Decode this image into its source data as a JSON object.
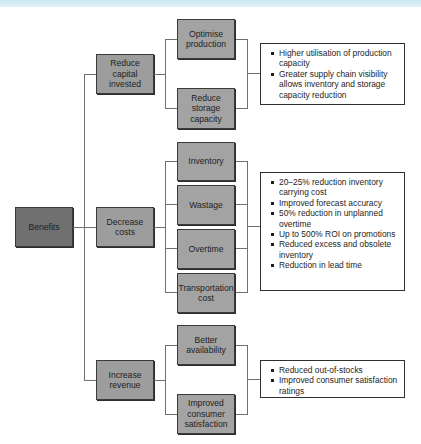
{
  "diagram": {
    "root": {
      "label": "Benefits"
    },
    "branches": [
      {
        "label": "Reduce capital invested",
        "children": [
          {
            "label": "Optimise production"
          },
          {
            "label": "Reduce storage capacity"
          }
        ],
        "outcomes": [
          "Higher utilisation of production capacity",
          "Greater supply chain visibility allows inventory and storage capacity reduction"
        ]
      },
      {
        "label": "Decrease costs",
        "children": [
          {
            "label": "Inventory"
          },
          {
            "label": "Wastage"
          },
          {
            "label": "Overtime"
          },
          {
            "label": "Transportation cost"
          }
        ],
        "outcomes": [
          "20–25% reduction inventory carrying cost",
          "Improved forecast accuracy",
          "50% reduction in unplanned overtime",
          "Up to 500% ROI on promotions",
          "Reduced excess and obsolete inventory",
          "Reduction in lead time"
        ]
      },
      {
        "label": "Increase revenue",
        "children": [
          {
            "label": "Better availability"
          },
          {
            "label": "Improved consumer satisfaction"
          }
        ],
        "outcomes": [
          "Reduced out-of-stocks",
          "Improved consumer satisfaction ratings"
        ]
      }
    ],
    "colors": {
      "root_fill": "#707070",
      "level1_fill": "#9d9d9d",
      "level2_fill": "#a3a3a3",
      "connector": "#707070",
      "top_band": "#c8e6f2"
    }
  }
}
